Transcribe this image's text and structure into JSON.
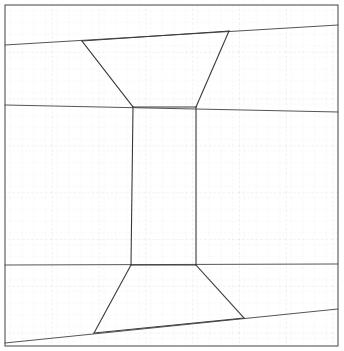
{
  "figure": {
    "type": "technical-line-drawing",
    "canvas": {
      "width": 344,
      "height": 351,
      "background": "#ffffff"
    },
    "colors": {
      "outline": "#3a3a3a",
      "frame": "#555555",
      "grid_minor": "#efe9ef",
      "grid_major": "#e2dde3",
      "background": "#ffffff"
    },
    "grid": {
      "visible": true,
      "style": "dotted",
      "minor_spacing_px": 11.7,
      "major_spacing_px": 46.8,
      "origin_x": 5,
      "origin_y": 5
    },
    "frame": {
      "x": 5,
      "y": 5,
      "width": 333,
      "height": 341,
      "stroke_width": 1.1
    },
    "shape_outline": {
      "name": "hourglass-outline",
      "closed": true,
      "stroke_width": 1.1,
      "vertices": [
        {
          "id": "top-left-waist-upper",
          "x": 82,
          "y": 41
        },
        {
          "id": "top-right-upper",
          "x": 229,
          "y": 31
        },
        {
          "id": "right-waist-top",
          "x": 196,
          "y": 107
        },
        {
          "id": "right-waist-bottom",
          "x": 196,
          "y": 265
        },
        {
          "id": "bottom-right",
          "x": 244,
          "y": 318
        },
        {
          "id": "bottom-left",
          "x": 94,
          "y": 333
        },
        {
          "id": "left-waist-bottom",
          "x": 131,
          "y": 265
        },
        {
          "id": "left-waist-top",
          "x": 133,
          "y": 107
        }
      ]
    },
    "guide_lines": [
      {
        "id": "upper-guide",
        "description": "near-horizontal line crossing full width through upper trapezoid top edge",
        "x1": 5,
        "y1": 45,
        "x2": 338,
        "y2": 25,
        "stroke_width": 1.0
      },
      {
        "id": "waist-upper-guide",
        "description": "near-horizontal line crossing full width at the upper waist",
        "x1": 5,
        "y1": 105,
        "x2": 338,
        "y2": 112,
        "stroke_width": 1.0
      },
      {
        "id": "waist-lower-guide",
        "description": "near-horizontal line crossing full width at the lower waist",
        "x1": 5,
        "y1": 265,
        "x2": 338,
        "y2": 264,
        "stroke_width": 1.0
      },
      {
        "id": "lower-guide",
        "description": "near-horizontal line crossing full width through lower trapezoid bottom edge",
        "x1": 5,
        "y1": 343,
        "x2": 338,
        "y2": 309,
        "stroke_width": 1.0
      }
    ],
    "segments": [
      {
        "id": "upper-top-edge",
        "x1": 82,
        "y1": 41,
        "x2": 229,
        "y2": 31
      },
      {
        "id": "upper-left-edge",
        "x1": 82,
        "y1": 41,
        "x2": 133,
        "y2": 107
      },
      {
        "id": "upper-right-edge",
        "x1": 229,
        "y1": 31,
        "x2": 196,
        "y2": 107
      },
      {
        "id": "waist-top-edge",
        "x1": 133,
        "y1": 107,
        "x2": 196,
        "y2": 107
      },
      {
        "id": "waist-left-edge",
        "x1": 133,
        "y1": 107,
        "x2": 131,
        "y2": 265
      },
      {
        "id": "waist-right-edge",
        "x1": 196,
        "y1": 107,
        "x2": 196,
        "y2": 265
      },
      {
        "id": "waist-bottom-edge",
        "x1": 131,
        "y1": 265,
        "x2": 196,
        "y2": 265
      },
      {
        "id": "lower-left-edge",
        "x1": 131,
        "y1": 265,
        "x2": 94,
        "y2": 333
      },
      {
        "id": "lower-right-edge",
        "x1": 196,
        "y1": 265,
        "x2": 244,
        "y2": 318
      },
      {
        "id": "lower-bottom-edge",
        "x1": 94,
        "y1": 333,
        "x2": 244,
        "y2": 318
      }
    ]
  }
}
